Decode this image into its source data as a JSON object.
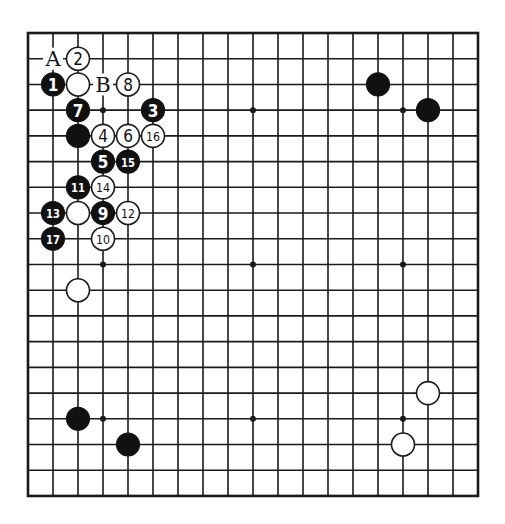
{
  "board": {
    "size": 19,
    "origin_x": 28,
    "origin_y": 33,
    "step_x": 25,
    "step_y": 25.72,
    "stone_radius": 11.5,
    "colors": {
      "line": "#1a1a1a",
      "black_stone": "#111111",
      "white_stone": "#ffffff",
      "background": "#ffffff"
    },
    "star_points": [
      [
        3,
        3
      ],
      [
        9,
        3
      ],
      [
        15,
        3
      ],
      [
        3,
        9
      ],
      [
        9,
        9
      ],
      [
        15,
        9
      ],
      [
        3,
        15
      ],
      [
        9,
        15
      ],
      [
        15,
        15
      ]
    ],
    "stones": [
      {
        "col": 2,
        "row": 1,
        "color": "white",
        "number": "2"
      },
      {
        "col": 1,
        "row": 2,
        "color": "black",
        "number": "1"
      },
      {
        "col": 2,
        "row": 2,
        "color": "white",
        "number": ""
      },
      {
        "col": 4,
        "row": 2,
        "color": "white",
        "number": "8"
      },
      {
        "col": 2,
        "row": 3,
        "color": "black",
        "number": "7"
      },
      {
        "col": 5,
        "row": 3,
        "color": "black",
        "number": "3"
      },
      {
        "col": 2,
        "row": 4,
        "color": "black",
        "number": ""
      },
      {
        "col": 3,
        "row": 4,
        "color": "white",
        "number": "4"
      },
      {
        "col": 4,
        "row": 4,
        "color": "white",
        "number": "6"
      },
      {
        "col": 5,
        "row": 4,
        "color": "white",
        "number": "16"
      },
      {
        "col": 3,
        "row": 5,
        "color": "black",
        "number": "5"
      },
      {
        "col": 4,
        "row": 5,
        "color": "black",
        "number": "15"
      },
      {
        "col": 2,
        "row": 6,
        "color": "black",
        "number": "11"
      },
      {
        "col": 3,
        "row": 6,
        "color": "white",
        "number": "14"
      },
      {
        "col": 1,
        "row": 7,
        "color": "black",
        "number": "13"
      },
      {
        "col": 2,
        "row": 7,
        "color": "white",
        "number": ""
      },
      {
        "col": 3,
        "row": 7,
        "color": "black",
        "number": "9"
      },
      {
        "col": 4,
        "row": 7,
        "color": "white",
        "number": "12"
      },
      {
        "col": 1,
        "row": 8,
        "color": "black",
        "number": "17"
      },
      {
        "col": 3,
        "row": 8,
        "color": "white",
        "number": "10"
      },
      {
        "col": 2,
        "row": 10,
        "color": "white",
        "number": ""
      },
      {
        "col": 14,
        "row": 2,
        "color": "black",
        "number": ""
      },
      {
        "col": 16,
        "row": 3,
        "color": "black",
        "number": ""
      },
      {
        "col": 16,
        "row": 14,
        "color": "white",
        "number": ""
      },
      {
        "col": 15,
        "row": 16,
        "color": "white",
        "number": ""
      },
      {
        "col": 2,
        "row": 15,
        "color": "black",
        "number": ""
      },
      {
        "col": 4,
        "row": 16,
        "color": "black",
        "number": ""
      }
    ],
    "labels": [
      {
        "col": 1,
        "row": 1,
        "text": "A"
      },
      {
        "col": 3,
        "row": 2,
        "text": "B"
      }
    ]
  }
}
